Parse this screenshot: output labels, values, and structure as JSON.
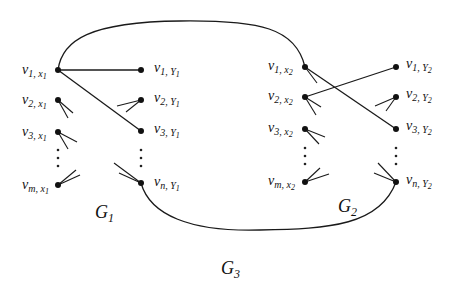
{
  "diagram": {
    "title": "G3",
    "graphs": [
      {
        "name": "G1",
        "label": "G",
        "label_sub": "1",
        "left_nodes": [
          {
            "id": "v1x1",
            "v": "v",
            "sub": "1, x",
            "subsub": "1"
          },
          {
            "id": "v2x1",
            "v": "v",
            "sub": "2, x",
            "subsub": "1"
          },
          {
            "id": "v3x1",
            "v": "v",
            "sub": "3, x",
            "subsub": "1"
          },
          {
            "id": "vmx1",
            "v": "v",
            "sub": "m, x",
            "subsub": "1"
          }
        ],
        "right_nodes": [
          {
            "id": "v1y1",
            "v": "v",
            "sub": "1, Y",
            "subsub": "1"
          },
          {
            "id": "v2y1",
            "v": "v",
            "sub": "2, Y",
            "subsub": "1"
          },
          {
            "id": "v3y1",
            "v": "v",
            "sub": "3, Y",
            "subsub": "1"
          },
          {
            "id": "vny1",
            "v": "v",
            "sub": "n, Y",
            "subsub": "1"
          }
        ]
      },
      {
        "name": "G2",
        "label": "G",
        "label_sub": "2",
        "left_nodes": [
          {
            "id": "v1x2",
            "v": "v",
            "sub": "1, x",
            "subsub": "2"
          },
          {
            "id": "v2x2",
            "v": "v",
            "sub": "2, x",
            "subsub": "2"
          },
          {
            "id": "v3x2",
            "v": "v",
            "sub": "3, x",
            "subsub": "2"
          },
          {
            "id": "vmx2",
            "v": "v",
            "sub": "m, x",
            "subsub": "2"
          }
        ],
        "right_nodes": [
          {
            "id": "v1y2",
            "v": "v",
            "sub": "1, Y",
            "subsub": "2"
          },
          {
            "id": "v2y2",
            "v": "v",
            "sub": "2, Y",
            "subsub": "2"
          },
          {
            "id": "v3y2",
            "v": "v",
            "sub": "3, Y",
            "subsub": "2"
          },
          {
            "id": "vny2",
            "v": "v",
            "sub": "n, Y",
            "subsub": "2"
          }
        ]
      }
    ],
    "composite": {
      "label": "G",
      "label_sub": "3"
    },
    "edges": [
      {
        "from": "v1x1",
        "to": "v1y1"
      },
      {
        "from": "v1x1",
        "to": "v3y1"
      },
      {
        "from": "v2x2",
        "to": "v1y2"
      },
      {
        "from": "v1x2",
        "to": "v3y2"
      },
      {
        "from": "v1x1",
        "to": "v1x2",
        "type": "curve-top"
      },
      {
        "from": "vny1",
        "to": "vny2",
        "type": "curve-bottom"
      }
    ],
    "ellipsis": "⋮"
  }
}
